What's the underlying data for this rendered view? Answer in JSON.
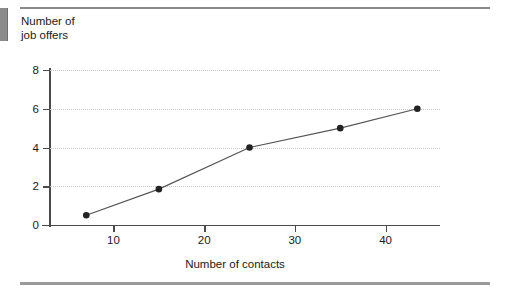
{
  "figure": {
    "y_axis_title": "Number of\njob offers",
    "x_axis_title": "Number of contacts"
  },
  "chart_data": {
    "type": "line",
    "title": "",
    "xlabel": "Number of contacts",
    "ylabel": "Number of job offers",
    "xlim": [
      3,
      46
    ],
    "ylim": [
      0,
      8
    ],
    "grid": true,
    "legend": null,
    "xticks": [
      10,
      20,
      30,
      40
    ],
    "yticks": [
      0,
      2,
      4,
      6,
      8
    ],
    "xtick_labels": [
      "10",
      "20",
      "30",
      "40"
    ],
    "ytick_labels": [
      "0",
      "2",
      "4",
      "6",
      "8"
    ],
    "marker": "filled-circle",
    "line_color": "#555555",
    "marker_color": "#222222",
    "gridline_color": "#c9c9cf",
    "axis_color": "#4a4a4a",
    "series": [
      {
        "name": "job offers vs contacts",
        "x": [
          7,
          15,
          25,
          35,
          43.5
        ],
        "y": [
          0.5,
          1.85,
          4.0,
          5.0,
          6.0
        ]
      }
    ]
  }
}
